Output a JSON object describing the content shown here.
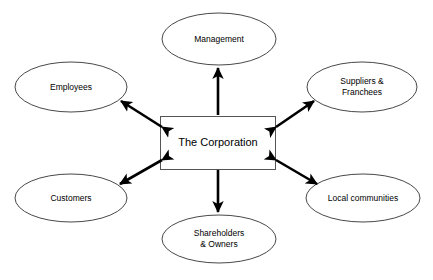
{
  "diagram": {
    "type": "hub-and-spoke-stakeholder-map",
    "background_color": "#ffffff",
    "shape_outline_color": "#333333",
    "shape_fill_color": "#ffffff",
    "arrow_color": "#000000",
    "center": {
      "id": "the-corporation",
      "label": "The Corporation",
      "shape": "rectangle",
      "x": 160,
      "y": 116,
      "width": 116,
      "height": 54
    },
    "nodes": [
      {
        "id": "management",
        "label": "Management",
        "shape": "ellipse",
        "position": "top",
        "cx": 219,
        "cy": 39,
        "rx": 57,
        "ry": 26
      },
      {
        "id": "employees",
        "label": "Employees",
        "shape": "ellipse",
        "position": "top-left",
        "cx": 71,
        "cy": 87,
        "rx": 56,
        "ry": 25
      },
      {
        "id": "suppliers-franchees",
        "label": "Suppliers &\nFranchees",
        "shape": "ellipse",
        "position": "top-right",
        "cx": 362,
        "cy": 87,
        "rx": 55,
        "ry": 25
      },
      {
        "id": "customers",
        "label": "Customers",
        "shape": "ellipse",
        "position": "bottom-left",
        "cx": 71,
        "cy": 198,
        "rx": 56,
        "ry": 24
      },
      {
        "id": "local-communities",
        "label": "Local communities",
        "shape": "ellipse",
        "position": "bottom-right",
        "cx": 363,
        "cy": 198,
        "rx": 57,
        "ry": 24
      },
      {
        "id": "shareholders-owners",
        "label": "Shareholders\n& Owners",
        "shape": "ellipse",
        "position": "bottom",
        "cx": 219,
        "cy": 239,
        "rx": 57,
        "ry": 24
      }
    ],
    "connectors": [
      {
        "id": "corporation-management",
        "from": "the-corporation",
        "to": "management",
        "arrowheads": "single",
        "direction": "to-management"
      },
      {
        "id": "corporation-employees",
        "from": "the-corporation",
        "to": "employees",
        "arrowheads": "double",
        "direction": "bidirectional"
      },
      {
        "id": "corporation-suppliers",
        "from": "the-corporation",
        "to": "suppliers-franchees",
        "arrowheads": "double",
        "direction": "bidirectional"
      },
      {
        "id": "corporation-customers",
        "from": "the-corporation",
        "to": "customers",
        "arrowheads": "double",
        "direction": "bidirectional"
      },
      {
        "id": "corporation-local-communities",
        "from": "the-corporation",
        "to": "local-communities",
        "arrowheads": "double",
        "direction": "bidirectional"
      },
      {
        "id": "corporation-shareholders",
        "from": "the-corporation",
        "to": "shareholders-owners",
        "arrowheads": "single",
        "direction": "to-shareholders"
      }
    ]
  }
}
